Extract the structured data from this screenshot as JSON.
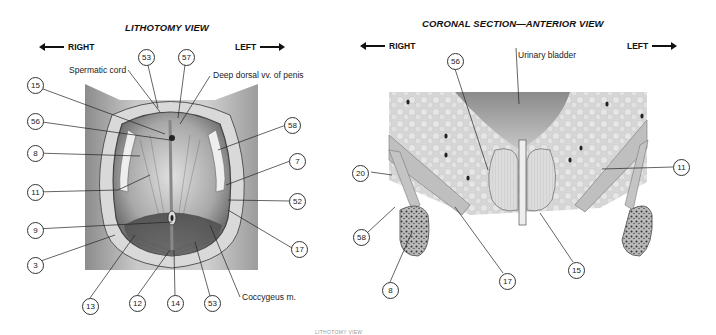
{
  "left_panel": {
    "title": "LITHOTOMY VIEW",
    "direction_left": "RIGHT",
    "direction_right": "LEFT",
    "text_labels": {
      "spermatic_cord": "Spermatic cord",
      "deep_dorsal": "Deep dorsal vv. of penis",
      "coccygeus": "Coccygeus m."
    },
    "callouts": [
      {
        "id": "53",
        "x": 138,
        "y": 49
      },
      {
        "id": "57",
        "x": 178,
        "y": 49
      },
      {
        "id": "15",
        "x": 27,
        "y": 77
      },
      {
        "id": "56",
        "x": 27,
        "y": 113
      },
      {
        "id": "8",
        "x": 27,
        "y": 145
      },
      {
        "id": "11",
        "x": 27,
        "y": 184
      },
      {
        "id": "9",
        "x": 27,
        "y": 222
      },
      {
        "id": "3",
        "x": 27,
        "y": 257
      },
      {
        "id": "58",
        "x": 284,
        "y": 117
      },
      {
        "id": "7",
        "x": 289,
        "y": 153
      },
      {
        "id": "52",
        "x": 289,
        "y": 193
      },
      {
        "id": "17",
        "x": 291,
        "y": 241
      },
      {
        "id": "13",
        "x": 82,
        "y": 298
      },
      {
        "id": "12",
        "x": 129,
        "y": 295
      },
      {
        "id": "14",
        "x": 167,
        "y": 295
      },
      {
        "id": "53",
        "x": 204,
        "y": 295
      }
    ]
  },
  "right_panel": {
    "title": "CORONAL SECTION—ANTERIOR VIEW",
    "direction_left": "RIGHT",
    "direction_right": "LEFT",
    "text_labels": {
      "urinary_bladder": "Urinary bladder"
    },
    "callouts": [
      {
        "id": "56",
        "x": 447,
        "y": 53
      },
      {
        "id": "20",
        "x": 352,
        "y": 165
      },
      {
        "id": "11",
        "x": 673,
        "y": 159
      },
      {
        "id": "58",
        "x": 353,
        "y": 229
      },
      {
        "id": "8",
        "x": 382,
        "y": 282
      },
      {
        "id": "17",
        "x": 499,
        "y": 273
      },
      {
        "id": "15",
        "x": 568,
        "y": 262
      }
    ]
  },
  "footer": "LITHOTOMY VIEW"
}
